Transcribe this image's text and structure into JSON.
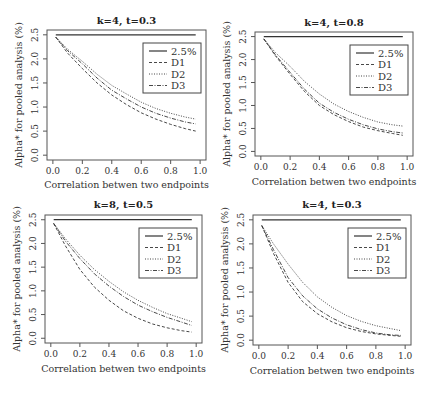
{
  "figure": {
    "xlabel": "Correlation betwen two endpoints",
    "ylabel": "Alpha* for pooled analysis (%)"
  },
  "chart_data": [
    {
      "type": "line",
      "title": "k=4, t=0.3",
      "xlabel": "Correlation betwen two endpoints",
      "ylabel": "Alpha* for pooled analysis (%)",
      "xlim": [
        0.0,
        1.0
      ],
      "ylim": [
        0.0,
        2.5
      ],
      "xticks": [
        "0.0",
        "0.2",
        "0.4",
        "0.6",
        "0.8",
        "1.0"
      ],
      "yticks": [
        "0.0",
        "0.5",
        "1.0",
        "1.5",
        "2.0",
        "2.5"
      ],
      "legend": [
        "2.5%",
        "D1",
        "D2",
        "D3"
      ],
      "legend_position": "upper right",
      "grid": false,
      "x": [
        0.02,
        0.1,
        0.2,
        0.3,
        0.4,
        0.5,
        0.6,
        0.7,
        0.8,
        0.9,
        0.97
      ],
      "series": [
        {
          "name": "2.5%",
          "style": "solid",
          "values": [
            2.5,
            2.5,
            2.5,
            2.5,
            2.5,
            2.5,
            2.5,
            2.5,
            2.5,
            2.5,
            2.5
          ]
        },
        {
          "name": "D1",
          "style": "dashed",
          "values": [
            2.45,
            2.12,
            1.8,
            1.5,
            1.25,
            1.05,
            0.88,
            0.75,
            0.64,
            0.55,
            0.5
          ]
        },
        {
          "name": "D2",
          "style": "dotted",
          "values": [
            2.45,
            2.2,
            1.95,
            1.68,
            1.45,
            1.27,
            1.1,
            0.97,
            0.87,
            0.79,
            0.75
          ]
        },
        {
          "name": "D3",
          "style": "dashdot",
          "values": [
            2.45,
            2.17,
            1.9,
            1.6,
            1.35,
            1.17,
            1.0,
            0.87,
            0.77,
            0.69,
            0.65
          ]
        }
      ]
    },
    {
      "type": "line",
      "title": "k=4, t=0.8",
      "xlabel": "Correlation betwen two endpoints",
      "ylabel": "Alpha* for pooled analysis (%)",
      "xlim": [
        0.0,
        1.0
      ],
      "ylim": [
        0.0,
        2.5
      ],
      "xticks": [
        "0.0",
        "0.2",
        "0.4",
        "0.6",
        "0.8",
        "1.0"
      ],
      "yticks": [
        "0.0",
        "0.5",
        "1.0",
        "1.5",
        "2.0",
        "2.5"
      ],
      "legend": [
        "2.5%",
        "D1",
        "D2",
        "D3"
      ],
      "legend_position": "upper right",
      "grid": false,
      "x": [
        0.02,
        0.1,
        0.2,
        0.3,
        0.4,
        0.5,
        0.6,
        0.7,
        0.8,
        0.9,
        0.97
      ],
      "series": [
        {
          "name": "2.5%",
          "style": "solid",
          "values": [
            2.5,
            2.5,
            2.5,
            2.5,
            2.5,
            2.5,
            2.5,
            2.5,
            2.5,
            2.5,
            2.5
          ]
        },
        {
          "name": "D1",
          "style": "dashed",
          "values": [
            2.45,
            2.08,
            1.68,
            1.3,
            1.0,
            0.8,
            0.65,
            0.53,
            0.45,
            0.39,
            0.35
          ]
        },
        {
          "name": "D2",
          "style": "dotted",
          "values": [
            2.45,
            2.15,
            1.85,
            1.52,
            1.25,
            1.03,
            0.87,
            0.74,
            0.64,
            0.58,
            0.55
          ]
        },
        {
          "name": "D3",
          "style": "dashdot",
          "values": [
            2.45,
            2.1,
            1.72,
            1.35,
            1.05,
            0.85,
            0.7,
            0.58,
            0.49,
            0.43,
            0.4
          ]
        }
      ]
    },
    {
      "type": "line",
      "title": "k=8, t=0.5",
      "xlabel": "Correlation betwen two endpoints",
      "ylabel": "Alpha* for pooled analysis (%)",
      "xlim": [
        0.0,
        1.0
      ],
      "ylim": [
        0.0,
        2.5
      ],
      "xticks": [
        "0.0",
        "0.2",
        "0.4",
        "0.6",
        "0.8",
        "1.0"
      ],
      "yticks": [
        "0.0",
        "0.5",
        "1.0",
        "1.5",
        "2.0",
        "2.5"
      ],
      "legend": [
        "2.5%",
        "D1",
        "D2",
        "D3"
      ],
      "legend_position": "upper right",
      "grid": false,
      "x": [
        0.02,
        0.1,
        0.2,
        0.3,
        0.4,
        0.5,
        0.6,
        0.7,
        0.8,
        0.9,
        0.97
      ],
      "series": [
        {
          "name": "2.5%",
          "style": "solid",
          "values": [
            2.5,
            2.5,
            2.5,
            2.5,
            2.5,
            2.5,
            2.5,
            2.5,
            2.5,
            2.5,
            2.5
          ]
        },
        {
          "name": "D1",
          "style": "dashed",
          "values": [
            2.42,
            1.95,
            1.45,
            1.08,
            0.8,
            0.58,
            0.42,
            0.3,
            0.22,
            0.16,
            0.13
          ]
        },
        {
          "name": "D2",
          "style": "dotted",
          "values": [
            2.42,
            2.1,
            1.75,
            1.45,
            1.2,
            0.98,
            0.8,
            0.65,
            0.52,
            0.42,
            0.35
          ]
        },
        {
          "name": "D3",
          "style": "dashdot",
          "values": [
            2.42,
            2.05,
            1.68,
            1.36,
            1.1,
            0.88,
            0.7,
            0.56,
            0.44,
            0.34,
            0.27
          ]
        }
      ]
    },
    {
      "type": "line",
      "title": "k=4, t=0.3",
      "xlabel": "Correlation betwen two endpoints",
      "ylabel": "Alpha* for pooled analysis (%)",
      "xlim": [
        0.0,
        1.0
      ],
      "ylim": [
        0.0,
        2.5
      ],
      "xticks": [
        "0.0",
        "0.2",
        "0.4",
        "0.6",
        "0.8",
        "1.0"
      ],
      "yticks": [
        "0.0",
        "0.5",
        "1.0",
        "1.5",
        "2.0",
        "2.5"
      ],
      "legend": [
        "2.5%",
        "D1",
        "D2",
        "D3"
      ],
      "legend_position": "upper right",
      "grid": false,
      "x": [
        0.02,
        0.1,
        0.2,
        0.3,
        0.4,
        0.5,
        0.6,
        0.7,
        0.8,
        0.9,
        0.97
      ],
      "series": [
        {
          "name": "2.5%",
          "style": "solid",
          "values": [
            2.5,
            2.5,
            2.5,
            2.5,
            2.5,
            2.5,
            2.5,
            2.5,
            2.5,
            2.5,
            2.5
          ]
        },
        {
          "name": "D1",
          "style": "dashed",
          "values": [
            2.38,
            1.8,
            1.2,
            0.8,
            0.55,
            0.38,
            0.26,
            0.18,
            0.13,
            0.1,
            0.08
          ]
        },
        {
          "name": "D2",
          "style": "dotted",
          "values": [
            2.38,
            2.0,
            1.58,
            1.2,
            0.9,
            0.68,
            0.51,
            0.39,
            0.3,
            0.24,
            0.2
          ]
        },
        {
          "name": "D3",
          "style": "dashdot",
          "values": [
            2.38,
            1.88,
            1.3,
            0.92,
            0.65,
            0.46,
            0.32,
            0.22,
            0.15,
            0.11,
            0.1
          ]
        }
      ]
    }
  ]
}
